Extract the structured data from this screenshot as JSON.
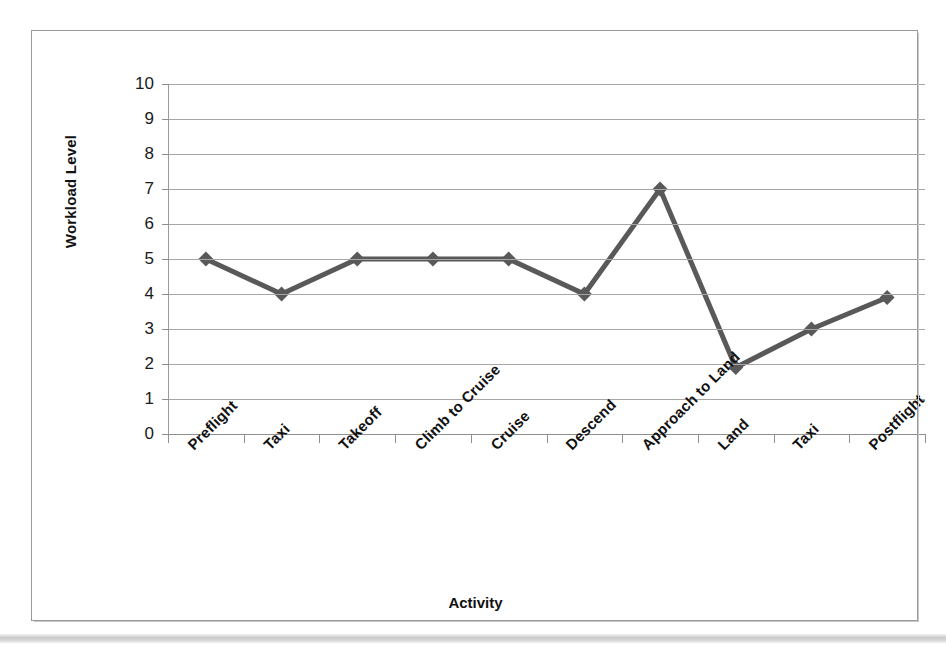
{
  "chart_data": {
    "type": "line",
    "title": "",
    "xlabel": "Activity",
    "ylabel": "Workload Level",
    "categories": [
      "Preflight",
      "Taxi",
      "Takeoff",
      "Climb to Cruise",
      "Cruise",
      "Descend",
      "Approach to Land",
      "Land",
      "Taxi",
      "Postflight"
    ],
    "values": [
      5,
      4,
      5,
      5,
      5,
      4,
      7,
      1.9,
      3,
      3.9
    ],
    "series": [
      {
        "name": "Workload Level",
        "values": [
          5,
          4,
          5,
          5,
          5,
          4,
          7,
          1.9,
          3,
          3.9
        ]
      }
    ],
    "ylim": [
      0,
      10
    ],
    "y_ticks": [
      0,
      1,
      2,
      3,
      4,
      5,
      6,
      7,
      8,
      9,
      10
    ],
    "y_tick_labels": [
      "0",
      "1",
      "2",
      "3",
      "4",
      "5",
      "6",
      "7",
      "8",
      "9",
      "10"
    ],
    "grid": true,
    "grid_axis": "y",
    "legend": false,
    "legend_position": "none",
    "marker": "diamond",
    "line_color": "#595959",
    "marker_color": "#595959",
    "grid_color": "#A6A6A6",
    "axis_color": "#8F8F8F",
    "text_color": "#111111",
    "background": "#FFFFFF",
    "x_label_rotation": -45
  }
}
